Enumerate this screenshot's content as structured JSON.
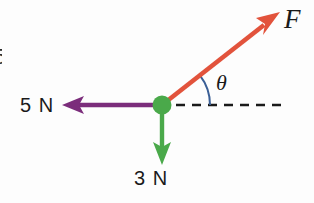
{
  "figure": {
    "background_color": "#fdfdfd",
    "width": 314,
    "height": 203,
    "origin": {
      "x": 162,
      "y": 105,
      "radius": 9,
      "color": "#4aa94a"
    }
  },
  "labels": {
    "force_f": "F",
    "angle_theta": "θ",
    "five_newton": "5 N",
    "three_newton": "3 N",
    "edge_fragment": "5"
  },
  "vectors": [
    {
      "name": "applied-force-F",
      "label": "F",
      "color": "#e2533c",
      "magnitude_label": null,
      "angle_degrees": 38,
      "direction": "up-right",
      "from": {
        "x": 162,
        "y": 105
      },
      "to": {
        "x": 279,
        "y": 13
      }
    },
    {
      "name": "force-5-newton",
      "label": "5 N",
      "color": "#7b2d7b",
      "magnitude_label": "5 N",
      "angle_degrees": 180,
      "direction": "left",
      "from": {
        "x": 162,
        "y": 105
      },
      "to": {
        "x": 63,
        "y": 105
      }
    },
    {
      "name": "force-3-newton",
      "label": "3 N",
      "color": "#4aa94a",
      "magnitude_label": "3 N",
      "angle_degrees": 270,
      "direction": "down",
      "from": {
        "x": 162,
        "y": 105
      },
      "to": {
        "x": 162,
        "y": 164
      }
    }
  ],
  "reference_axis": {
    "name": "horizontal-dashed-axis",
    "color": "#1a1a1a",
    "style": "dashed",
    "from": {
      "x": 176,
      "y": 105
    },
    "to": {
      "x": 287,
      "y": 105
    }
  },
  "angle_arc": {
    "name": "theta-arc",
    "color": "#3a5f96",
    "label": "θ",
    "radius": 48,
    "start_degrees": 0,
    "end_degrees": 38
  },
  "colors": {
    "force_red": "#e2533c",
    "force_purple": "#7b2d7b",
    "force_green": "#4aa94a",
    "arc_blue": "#3a5f96",
    "axis_black": "#1a1a1a",
    "text": "#1a1a1a",
    "background": "#fdfdfd"
  }
}
